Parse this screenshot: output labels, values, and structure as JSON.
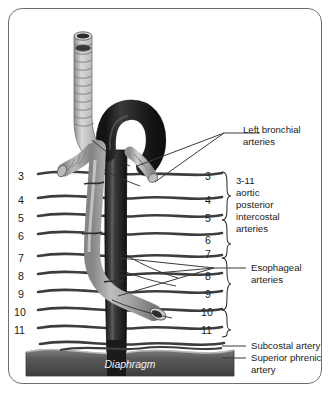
{
  "figure": {
    "background_color": "#ffffff",
    "frame_color": "#6f6f6f"
  },
  "labels": {
    "left_bronchial": "Left bronchial\narteries",
    "left_bronchial_line1": "Left bronchial",
    "left_bronchial_line2": "arteries",
    "aortic_intercostal_line1": "3-11",
    "aortic_intercostal_line2": "aortic",
    "aortic_intercostal_line3": "posterior",
    "aortic_intercostal_line4": "intercostal",
    "aortic_intercostal_line5": "arteries",
    "esophageal_line1": "Esophageal",
    "esophageal_line2": "arteries",
    "subcostal": "Subcostal artery",
    "superior_phrenic_line1": "Superior phrenic",
    "superior_phrenic_line2": "artery",
    "diaphragm": "Diaphragm"
  },
  "left_numbers": [
    {
      "text": "3",
      "y": 176
    },
    {
      "text": "4",
      "y": 200
    },
    {
      "text": "5",
      "y": 218
    },
    {
      "text": "6",
      "y": 236
    },
    {
      "text": "7",
      "y": 258
    },
    {
      "text": "8",
      "y": 276
    },
    {
      "text": "9",
      "y": 294
    },
    {
      "text": "10",
      "y": 312
    },
    {
      "text": "11",
      "y": 330
    }
  ],
  "right_numbers": [
    {
      "text": "3",
      "y": 176
    },
    {
      "text": "4",
      "y": 200
    },
    {
      "text": "5",
      "y": 218
    },
    {
      "text": "6",
      "y": 240
    },
    {
      "text": "7",
      "y": 254
    },
    {
      "text": "8",
      "y": 276
    },
    {
      "text": "9",
      "y": 294
    },
    {
      "text": "10",
      "y": 312
    },
    {
      "text": "11",
      "y": 330
    }
  ],
  "intercostal_vessels": [
    {
      "y": 172
    },
    {
      "y": 196
    },
    {
      "y": 214
    },
    {
      "y": 232
    },
    {
      "y": 254
    },
    {
      "y": 272
    },
    {
      "y": 290
    },
    {
      "y": 308
    },
    {
      "y": 326
    },
    {
      "y": 342
    }
  ],
  "colors": {
    "aorta_dark": "#2a2a2a",
    "esophagus_light": "#b3b3b3",
    "trachea_light": "#c4c4c4",
    "vessel_line": "#3d3d3d",
    "diaphragm_band": "#5a5a5a",
    "text": "#1b1b1b"
  },
  "structures": [
    {
      "name": "trachea",
      "tone": "light"
    },
    {
      "name": "aortic-arch",
      "tone": "dark"
    },
    {
      "name": "descending-aorta",
      "tone": "dark"
    },
    {
      "name": "esophagus",
      "tone": "light"
    },
    {
      "name": "left-main-bronchus",
      "tone": "light"
    },
    {
      "name": "diaphragm",
      "tone": "dark"
    }
  ]
}
